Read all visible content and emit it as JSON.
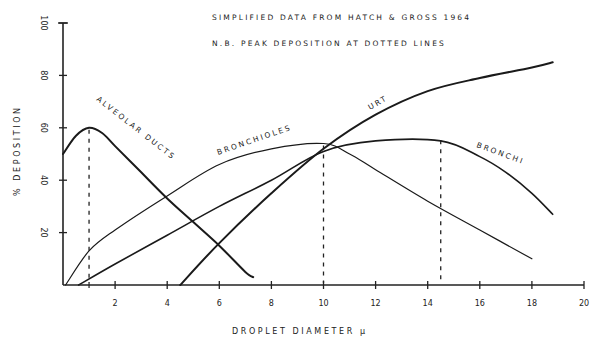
{
  "chart_data": {
    "type": "line",
    "title": "",
    "annotations": [
      "SIMPLIFIED DATA FROM HATCH & GROSS 1964",
      "N.B. PEAK DEPOSITION AT DOTTED LINES"
    ],
    "xlabel": "DROPLET DIAMETER μ",
    "ylabel": "% DEPOSITION",
    "xlim": [
      0,
      20
    ],
    "ylim": [
      0,
      100
    ],
    "x_ticks": [
      2,
      4,
      6,
      8,
      10,
      12,
      14,
      16,
      18,
      20
    ],
    "y_ticks": [
      20,
      40,
      60,
      80,
      100
    ],
    "grid": false,
    "legend": "inline labels on curves",
    "peak_lines": [
      1,
      10,
      14.5
    ],
    "series": [
      {
        "name": "ALVEOLAR DUCTS",
        "x": [
          0,
          0.5,
          1,
          1.5,
          2,
          3,
          4,
          5,
          6,
          7,
          7.3
        ],
        "y": [
          50,
          57,
          60,
          58,
          53,
          43,
          33,
          24,
          15,
          5,
          3
        ],
        "stroke_width": 2
      },
      {
        "name": "BRONCHIOLES",
        "x": [
          0.1,
          1,
          2,
          4,
          6,
          8,
          10,
          11,
          12,
          14,
          16,
          18
        ],
        "y": [
          0,
          13,
          21,
          34,
          46,
          52,
          54,
          50,
          44,
          32,
          21,
          10
        ],
        "stroke_width": 1.2
      },
      {
        "name": "BRONCHI",
        "x": [
          0.6,
          2,
          4,
          6,
          8,
          10,
          12,
          14.5,
          16,
          17,
          18,
          18.8
        ],
        "y": [
          0,
          8,
          19,
          30,
          40,
          51,
          55,
          55,
          49,
          43,
          35,
          27
        ],
        "stroke_width": 1.6
      },
      {
        "name": "URT",
        "x": [
          4.5,
          6,
          8,
          10,
          12,
          14,
          16,
          18,
          18.8
        ],
        "y": [
          0,
          16,
          35,
          52,
          65,
          74,
          79,
          83,
          85
        ],
        "stroke_width": 2
      }
    ]
  },
  "labels": {
    "note1": "SIMPLIFIED DATA FROM HATCH & GROSS 1964",
    "note2": "N.B. PEAK DEPOSITION AT DOTTED LINES",
    "xlabel": "DROPLET DIAMETER  μ",
    "ylabel": "% DEPOSITION",
    "alveolar": "ALVEOLAR DUCTS",
    "bronchioles": "BRONCHIOLES",
    "bronchi": "BRONCHI",
    "urt": "URT"
  }
}
